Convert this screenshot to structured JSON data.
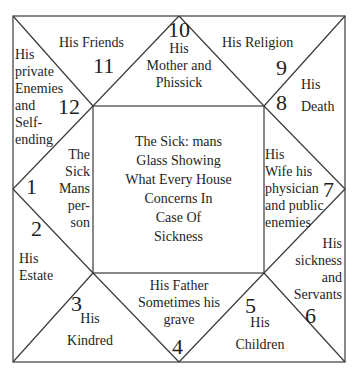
{
  "chart": {
    "title_center": [
      "The Sick: mans",
      "Glass Showing",
      "What Every House",
      "Concerns In",
      "Case Of",
      "Sickness"
    ],
    "line_color": "#3a3a3a",
    "houses": [
      {
        "number": "1",
        "label_lines": [
          "The",
          "Sick",
          "Mans",
          "per-",
          "son"
        ]
      },
      {
        "number": "2",
        "label_lines": [
          "His",
          "Estate"
        ]
      },
      {
        "number": "3",
        "label_lines": [
          "His",
          "Kindred"
        ]
      },
      {
        "number": "4",
        "label_lines": [
          "His Father",
          "Sometimes his",
          "grave"
        ]
      },
      {
        "number": "5",
        "label_lines": [
          "His",
          "Children"
        ]
      },
      {
        "number": "6",
        "label_lines": [
          "His",
          "sickness",
          "and",
          "Servants"
        ]
      },
      {
        "number": "7",
        "label_lines": [
          "His",
          "Wife his",
          "physician",
          "and public",
          "enemies"
        ]
      },
      {
        "number": "8",
        "label_lines": [
          "His",
          "Death"
        ]
      },
      {
        "number": "9",
        "label_lines": [
          "His Religion"
        ]
      },
      {
        "number": "10",
        "label_lines": [
          "His",
          "Mother and",
          "Phissick"
        ]
      },
      {
        "number": "11",
        "label_lines": [
          "His Friends"
        ]
      },
      {
        "number": "12",
        "label_lines": [
          "His",
          "private",
          "Enemies",
          "and",
          "Self-",
          "ending"
        ]
      }
    ]
  }
}
